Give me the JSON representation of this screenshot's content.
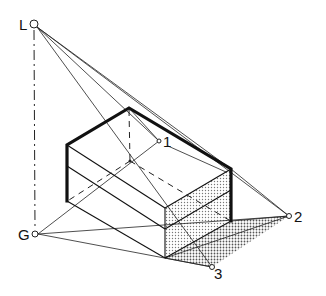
{
  "figure": {
    "points": {
      "L": {
        "label": "L",
        "meaning": "light source"
      },
      "G": {
        "label": "G",
        "meaning": "ground projection of light source"
      },
      "p1": {
        "label": "1"
      },
      "p2": {
        "label": "2"
      },
      "p3": {
        "label": "3"
      }
    },
    "colors": {
      "ink": "#111111",
      "background": "#ffffff",
      "shade": "#9a9a9a"
    }
  }
}
